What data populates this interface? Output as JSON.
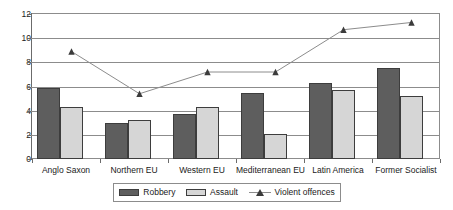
{
  "chart_data": {
    "type": "bar",
    "title": "",
    "subtitle": "",
    "xlabel": "",
    "ylabel": "",
    "ylim": [
      0,
      12
    ],
    "ytick_values": [
      12,
      10,
      8,
      6,
      4,
      2,
      0
    ],
    "ytick_labels": [
      "12",
      "10",
      "8",
      "6",
      "4",
      "2",
      "0"
    ],
    "grid": true,
    "legend_position": "bottom",
    "categories": [
      "Anglo Saxon",
      "Northern EU",
      "Western EU",
      "Mediterranean EU",
      "Latin America",
      "Former Socialist"
    ],
    "series": [
      {
        "name": "Robbery",
        "type": "bar",
        "color": "#5e5e5e",
        "values": [
          5.9,
          3.0,
          3.7,
          5.5,
          6.3,
          7.5
        ]
      },
      {
        "name": "Assault",
        "type": "bar",
        "color": "#d6d6d6",
        "values": [
          4.3,
          3.2,
          4.3,
          2.1,
          5.7,
          5.2
        ]
      },
      {
        "name": "Violent offences",
        "type": "line",
        "color": "#8c8c8c",
        "marker": "triangle",
        "values": [
          8.9,
          5.4,
          7.2,
          7.2,
          10.7,
          11.3
        ]
      }
    ]
  },
  "legend": {
    "items": [
      {
        "label": "Robbery",
        "style": "swatch-dark"
      },
      {
        "label": "Assault",
        "style": "swatch-light"
      },
      {
        "label": "Violent offences",
        "style": "line-marker"
      }
    ]
  }
}
